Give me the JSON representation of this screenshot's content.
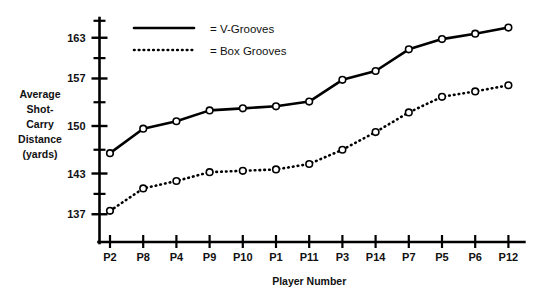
{
  "chart_data": {
    "type": "line",
    "title": "",
    "xlabel": "Player Number",
    "ylabel": "Average Shot-Carry Distance (yards)",
    "ylabel_lines": [
      "Average",
      "Shot-",
      "Carry",
      "Distance",
      "(yards)"
    ],
    "categories": [
      "P2",
      "P8",
      "P4",
      "P9",
      "P10",
      "P1",
      "P11",
      "P3",
      "P14",
      "P7",
      "P5",
      "P6",
      "P12"
    ],
    "ylim": [
      133.5,
      166.5
    ],
    "y_major_ticks": [
      137,
      143,
      150,
      157,
      163
    ],
    "y_minor_ticks": [
      140,
      146.5,
      153.5,
      160,
      165.5
    ],
    "y_tick_labels": [
      "137",
      "143",
      "150",
      "157",
      "163"
    ],
    "grid": false,
    "legend_position": "top-center",
    "series": [
      {
        "name": "V-Grooves",
        "legend_label": "= V-Grooves",
        "style": "solid",
        "values": [
          146.0,
          149.6,
          150.7,
          152.3,
          152.6,
          152.9,
          153.6,
          156.8,
          158.1,
          161.3,
          162.8,
          163.6,
          164.5
        ]
      },
      {
        "name": "Box Grooves",
        "legend_label": "= Box Grooves",
        "style": "dotted",
        "values": [
          137.5,
          140.8,
          141.9,
          143.2,
          143.4,
          143.6,
          144.4,
          146.5,
          149.1,
          152.0,
          154.3,
          155.1,
          156.0
        ]
      }
    ]
  },
  "colors": {
    "line": "#000000",
    "marker_fill": "#ffffff",
    "text": "#111111",
    "background": "#ffffff"
  }
}
